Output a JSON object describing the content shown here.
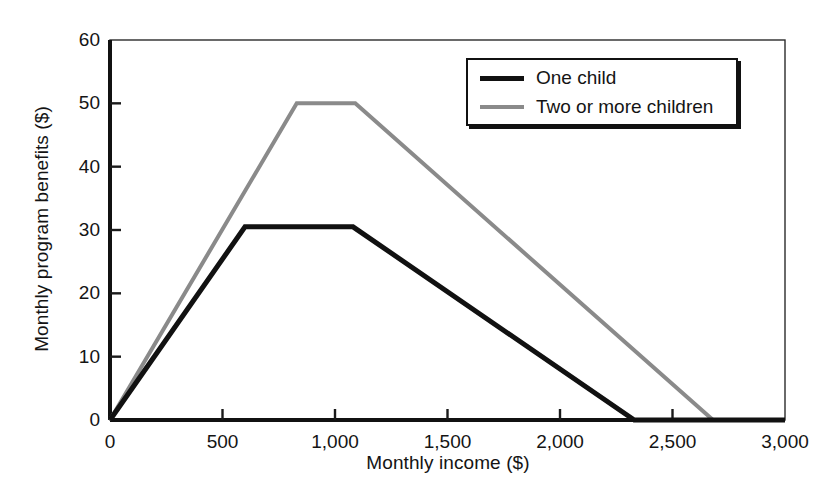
{
  "chart_data": {
    "type": "line",
    "title": "",
    "xlabel": "Monthly income ($)",
    "ylabel": "Monthly program benefits ($)",
    "xlim": [
      0,
      3000
    ],
    "ylim": [
      0,
      60
    ],
    "xticks": [
      0,
      500,
      1000,
      1500,
      2000,
      2500,
      3000
    ],
    "xtick_labels": [
      "0",
      "500",
      "1,000",
      "1,500",
      "2,000",
      "2,500",
      "3,000"
    ],
    "yticks": [
      0,
      10,
      20,
      30,
      40,
      50,
      60
    ],
    "ytick_labels": [
      "0",
      "10",
      "20",
      "30",
      "40",
      "50",
      "60"
    ],
    "grid": false,
    "legend_position": "top-right",
    "series": [
      {
        "name": "One child",
        "color": "#111111",
        "line_width": 5,
        "x": [
          0,
          600,
          1080,
          2330,
          3000
        ],
        "y": [
          0,
          30.5,
          30.5,
          0,
          0
        ]
      },
      {
        "name": "Two or more children",
        "color": "#8a8a8a",
        "line_width": 4,
        "x": [
          0,
          830,
          1090,
          2680,
          3000
        ],
        "y": [
          0,
          50,
          50,
          0,
          0
        ]
      }
    ]
  },
  "axes": {
    "plot_left_px": 110,
    "plot_right_px": 785,
    "plot_top_px": 40,
    "plot_bottom_px": 420,
    "frame_color": "#111111"
  }
}
